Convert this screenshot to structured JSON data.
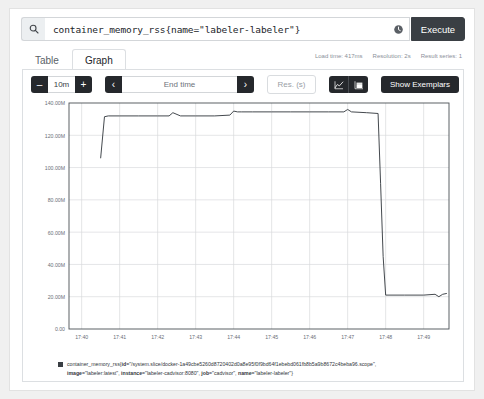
{
  "query": {
    "expression": "container_memory_rss{name=\"labeler-labeler\"}",
    "search_icon": "search-icon",
    "history_icon": "history-clock-icon",
    "execute_label": "Execute"
  },
  "tabs": [
    {
      "label": "Table",
      "active": false
    },
    {
      "label": "Graph",
      "active": true
    }
  ],
  "meta": {
    "load_time": "Load time: 417ms",
    "resolution": "Resolution: 2s",
    "result_series": "Result series: 1"
  },
  "controls": {
    "range_decrement": "–",
    "range_value": "10m",
    "range_increment": "+",
    "time_prev": "‹",
    "end_time_placeholder": "End time",
    "time_next": "›",
    "resolution_placeholder": "Res. (s)",
    "chart_type_line_icon": "line-chart-icon",
    "chart_type_stacked_icon": "stacked-chart-icon",
    "show_exemplars_label": "Show Exemplars"
  },
  "legend": {
    "metric_name": "container_memory_rss",
    "open_brace": "{",
    "id_key": "id",
    "id_value": "=\"/system.slice/docker-1a49cbe5260d8720402d0a8e95f0f9bd64f1ebebd061fb8b5a9b8672c4beba96.scope\",",
    "image_key": "image",
    "image_value": "=\"labeler:latest\",",
    "instance_key": "instance",
    "instance_value": "=\"labeler-cadvisor:8080\",",
    "job_key": "job",
    "job_value": "=\"cadvisor\",",
    "name_key": "name",
    "name_value": "=\"labeler-labeler\"}"
  },
  "chart_data": {
    "type": "line",
    "title": "",
    "xlabel": "",
    "ylabel": "",
    "series_color": "#3a3f44",
    "grid": true,
    "legend_position": "bottom",
    "ylim": [
      0,
      140000000
    ],
    "ytick_labels": [
      "0.00",
      "20.00M",
      "40.00M",
      "60.00M",
      "80.00M",
      "100.00M",
      "120.00M",
      "140.00M"
    ],
    "ytick_values": [
      0,
      20000000,
      40000000,
      60000000,
      80000000,
      100000000,
      120000000,
      140000000
    ],
    "xtick_labels": [
      "17:40",
      "17:41",
      "17:42",
      "17:43",
      "17:44",
      "17:45",
      "17:46",
      "17:47",
      "17:48",
      "17:49"
    ],
    "xlim": [
      "17:39:40",
      "17:49:40"
    ],
    "x": [
      "17:40:30",
      "17:40:36",
      "17:40:42",
      "17:41:00",
      "17:41:30",
      "17:42:00",
      "17:42:18",
      "17:42:24",
      "17:42:36",
      "17:43:00",
      "17:43:30",
      "17:43:54",
      "17:44:00",
      "17:44:06",
      "17:44:12",
      "17:44:30",
      "17:45:00",
      "17:45:30",
      "17:46:00",
      "17:46:30",
      "17:46:54",
      "17:47:00",
      "17:47:06",
      "17:47:30",
      "17:47:48",
      "17:47:52",
      "17:47:56",
      "17:48:00",
      "17:48:30",
      "17:49:00",
      "17:49:18",
      "17:49:24",
      "17:49:30",
      "17:49:36"
    ],
    "values": [
      106000000,
      131500000,
      132000000,
      132000000,
      132000000,
      132000000,
      132000000,
      134000000,
      132000000,
      132000000,
      132000000,
      132500000,
      135000000,
      134500000,
      134500000,
      134500000,
      134500000,
      134500000,
      134500000,
      134500000,
      134500000,
      136000000,
      134500000,
      134000000,
      133500000,
      90000000,
      45000000,
      21000000,
      21000000,
      21000000,
      21500000,
      20000000,
      21500000,
      22000000
    ]
  }
}
